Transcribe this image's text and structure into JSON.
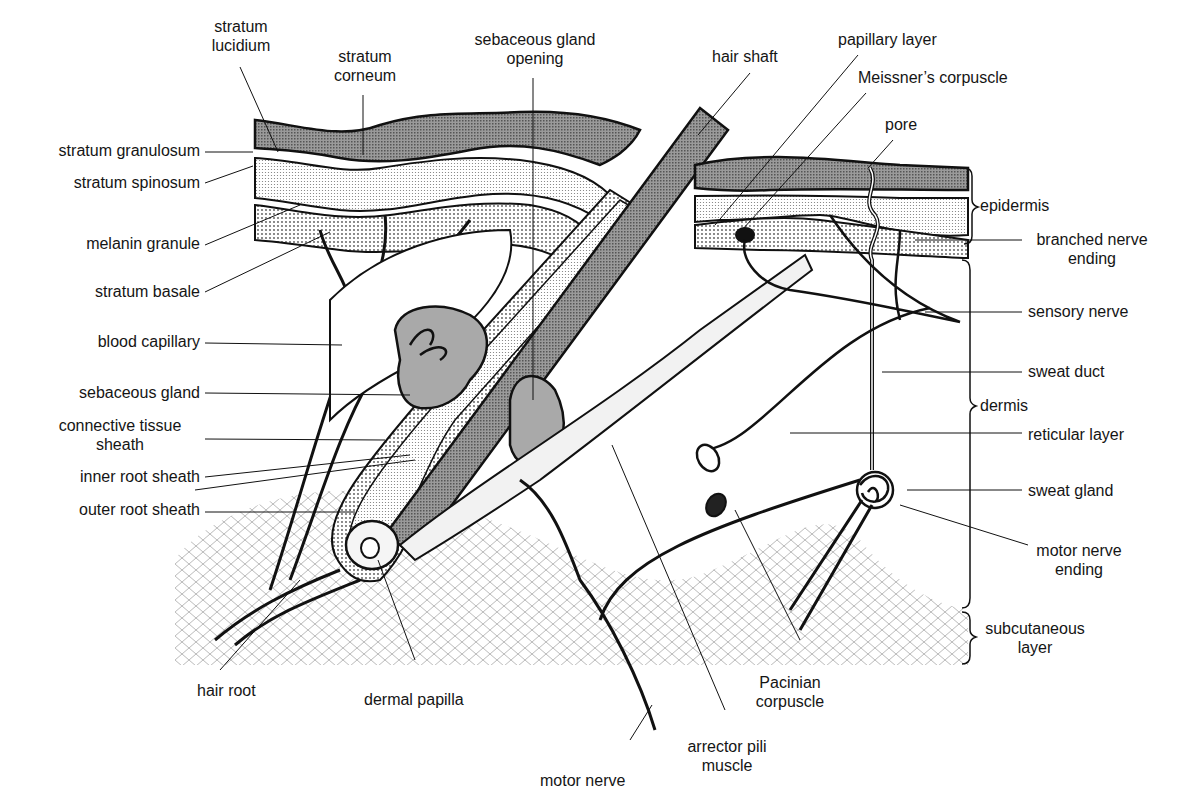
{
  "figure": {
    "colors": {
      "stratum_corneum": "#8a8a8a",
      "sebaceous_gland": "#a9a9a9",
      "hair_shaft": "#6f6f6f",
      "ink": "#111111",
      "stipple": "#cfcfcf",
      "subcutaneous": "#d8d8d8"
    }
  },
  "labels": {
    "stratum_lucidium": [
      "stratum",
      "lucidium"
    ],
    "stratum_corneum": [
      "stratum",
      "corneum"
    ],
    "sebaceous_gland_opening": [
      "sebaceous gland",
      "opening"
    ],
    "hair_shaft": "hair shaft",
    "papillary_layer": "papillary layer",
    "meissners_corpuscle": "Meissner’s corpuscle",
    "pore": "pore",
    "stratum_granulosum": "stratum granulosum",
    "stratum_spinosum": "stratum spinosum",
    "melanin_granule": "melanin granule",
    "stratum_basale": "stratum basale",
    "blood_capillary": "blood capillary",
    "sebaceous_gland": "sebaceous gland",
    "connective_tissue_sheath": [
      "connective tissue",
      "sheath"
    ],
    "inner_root_sheath": "inner root sheath",
    "outer_root_sheath": "outer root sheath",
    "epidermis": "epidermis",
    "branched_nerve_ending": [
      "branched nerve",
      "ending"
    ],
    "sensory_nerve": "sensory nerve",
    "sweat_duct": "sweat duct",
    "dermis": "dermis",
    "reticular_layer": "reticular layer",
    "sweat_gland": "sweat gland",
    "motor_nerve_ending": [
      "motor nerve",
      "ending"
    ],
    "subcutaneous_layer": [
      "subcutaneous",
      "layer"
    ],
    "hair_root": "hair root",
    "dermal_papilla": "dermal papilla",
    "pacinian_corpuscle": [
      "Pacinian",
      "corpuscle"
    ],
    "arrector_pili_muscle": [
      "arrector pili",
      "muscle"
    ],
    "motor_nerve": "motor nerve"
  }
}
